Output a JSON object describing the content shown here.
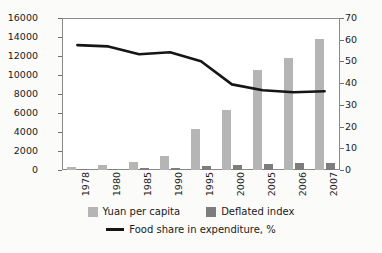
{
  "chart_data": {
    "type": "bar",
    "title": "",
    "subtitle": "",
    "xlabel": "",
    "ylabel": "",
    "categories": [
      "1978",
      "1980",
      "1985",
      "1990",
      "1995",
      "2000",
      "2005",
      "2006",
      "2007"
    ],
    "y_left": {
      "label": "",
      "ylim": [
        0,
        16000
      ],
      "step": 2000,
      "ticks": [
        "0",
        "2000",
        "4000",
        "6000",
        "8000",
        "10000",
        "12000",
        "14000",
        "16000"
      ]
    },
    "y_right": {
      "label": "",
      "ylim": [
        0,
        70
      ],
      "step": 10,
      "ticks": [
        "0",
        "10",
        "20",
        "30",
        "40",
        "50",
        "60",
        "70"
      ]
    },
    "grid": false,
    "legend_position": "bottom",
    "series": [
      {
        "name": "Yuan per capita",
        "type": "bar",
        "axis": "left",
        "color": "#b5b5b5",
        "values": [
          311,
          489,
          802,
          1510,
          4283,
          6280,
          10493,
          11760,
          13786
        ]
      },
      {
        "name": "Deflated index",
        "type": "bar",
        "axis": "left",
        "color": "#7d7d7d",
        "values": [
          100,
          122,
          190,
          260,
          400,
          480,
          640,
          700,
          760
        ]
      },
      {
        "name": "Food share in expenditure, %",
        "type": "line",
        "axis": "right",
        "color": "#151515",
        "values": [
          57.5,
          56.9,
          53.3,
          54.2,
          50.1,
          39.4,
          36.7,
          35.8,
          36.3
        ]
      }
    ]
  }
}
